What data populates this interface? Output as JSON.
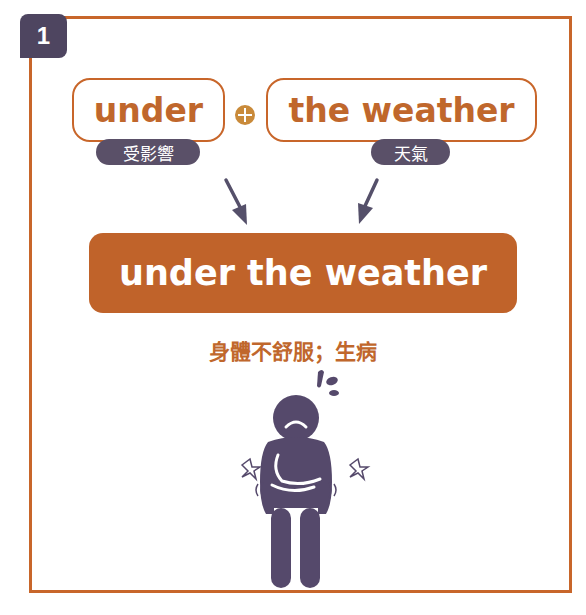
{
  "badge": {
    "number": "1"
  },
  "parts": [
    {
      "word": "under",
      "gloss": "受影響"
    },
    {
      "word": "the weather",
      "gloss": "天氣"
    }
  ],
  "operator": "plus-icon",
  "idiom": {
    "phrase": "under the weather",
    "meaning": "身體不舒服；生病"
  },
  "illustration": "sick-person-icon",
  "colors": {
    "accent": "#c0632a",
    "border": "#c8662a",
    "dark": "#4e4560",
    "plus": "#c98a3a"
  }
}
